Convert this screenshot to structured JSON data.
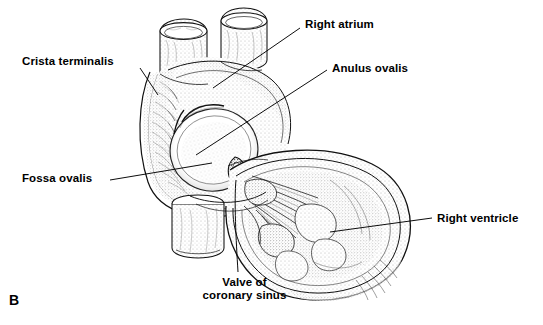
{
  "figure": {
    "panel_letter": "B",
    "background_color": "#ffffff",
    "ink_color": "#000000"
  },
  "labels": [
    {
      "id": "crista-terminalis",
      "text": "Crista terminalis",
      "x": 22,
      "y": 55,
      "align": "left",
      "leader": {
        "x1": 140,
        "y1": 68,
        "x2": 158,
        "y2": 95
      }
    },
    {
      "id": "right-atrium",
      "text": "Right atrium",
      "x": 305,
      "y": 18,
      "align": "left",
      "leader": {
        "x1": 300,
        "y1": 28,
        "x2": 213,
        "y2": 88
      }
    },
    {
      "id": "anulus-ovalis",
      "text": "Anulus ovalis",
      "x": 332,
      "y": 62,
      "align": "left",
      "leader": {
        "x1": 327,
        "y1": 70,
        "x2": 196,
        "y2": 155
      }
    },
    {
      "id": "fossa-ovalis",
      "text": "Fossa ovalis",
      "x": 22,
      "y": 172,
      "align": "left",
      "leader": {
        "x1": 110,
        "y1": 180,
        "x2": 212,
        "y2": 163
      }
    },
    {
      "id": "right-ventricle",
      "text": "Right ventricle",
      "x": 437,
      "y": 212,
      "align": "left",
      "leader": {
        "x1": 432,
        "y1": 218,
        "x2": 330,
        "y2": 232
      }
    },
    {
      "id": "valve-of-coronary-sinus",
      "text": "Valve of\ncoronary sinus",
      "x": 192,
      "y": 276,
      "align": "center",
      "leader": {
        "x1": 238,
        "y1": 272,
        "x2": 236,
        "y2": 178
      }
    }
  ],
  "structures": [
    {
      "id": "superior-vena-cava-stump",
      "label": "superior vena cava stump"
    },
    {
      "id": "pulmonary-vein-stump",
      "label": "pulmonary vein stump"
    },
    {
      "id": "inferior-vena-cava-stump",
      "label": "inferior vena cava stump"
    },
    {
      "id": "atrial-wall-flap",
      "label": "opened right atrial wall"
    },
    {
      "id": "fossa-ovalis-depression",
      "label": "fossa ovalis"
    },
    {
      "id": "coronary-sinus-valve",
      "label": "valve of coronary sinus"
    },
    {
      "id": "ventricle-chamber",
      "label": "right ventricle chamber"
    },
    {
      "id": "chordae-tendineae",
      "label": "chordae tendineae"
    },
    {
      "id": "trabeculae-carneae",
      "label": "trabeculae carneae"
    }
  ]
}
